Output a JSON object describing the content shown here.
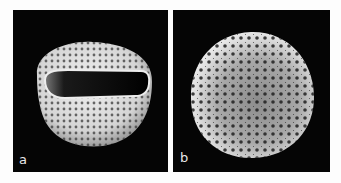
{
  "figure": {
    "panels": [
      {
        "id": "a",
        "label": "a",
        "subject": "pollen grain with elongated aperture (colpus), equatorial view",
        "background": "#050505"
      },
      {
        "id": "b",
        "label": "b",
        "subject": "spheroidal pollen grain with reticulate/perforate surface",
        "background": "#050505"
      }
    ],
    "colors": {
      "page_background": "#fdfdfd",
      "panel_background": "#050505",
      "grain_highlight": "#e6e6e6",
      "grain_shadow": "#6a6a6a",
      "label_text": "#e8e8e8"
    }
  }
}
